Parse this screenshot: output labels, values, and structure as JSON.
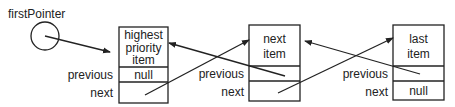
{
  "diagram": {
    "type": "doubly-linked-list",
    "pointer": {
      "label": "firstPointer",
      "points_to": "node-0"
    },
    "field_labels": {
      "previous": "previous",
      "next": "next"
    },
    "nodes": [
      {
        "id": "node-0",
        "title_lines": [
          "highest",
          "priority",
          "item"
        ],
        "previous": "null",
        "next": "",
        "next_points_to": "node-1"
      },
      {
        "id": "node-1",
        "title_lines": [
          "next",
          "item"
        ],
        "previous": "",
        "previous_points_to": "node-0",
        "next": "",
        "next_points_to": "node-2"
      },
      {
        "id": "node-2",
        "title_lines": [
          "last",
          "item"
        ],
        "previous": "",
        "previous_points_to": "node-1",
        "next": "null"
      }
    ]
  }
}
